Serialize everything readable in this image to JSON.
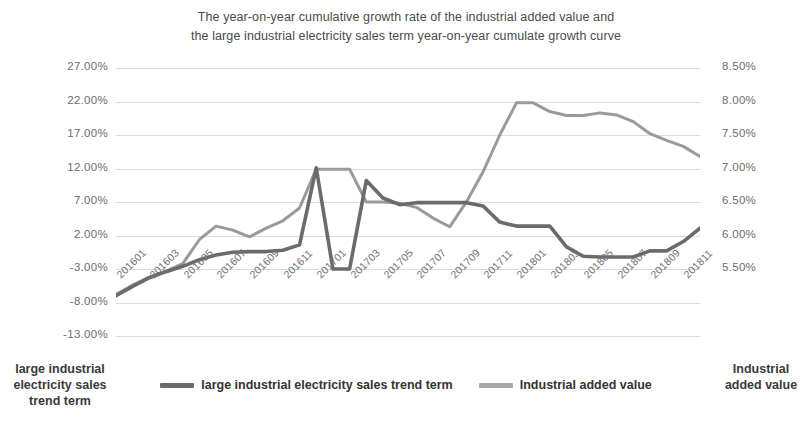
{
  "chart_data": {
    "type": "line",
    "title": "The year-on-year cumulative growth rate of the industrial added value and the large industrial electricity sales term year-on-year cumulate growth curve",
    "title_lines": [
      "The year-on-year cumulative growth rate of the industrial added value and",
      "the large industrial electricity sales term year-on-year cumulate growth curve"
    ],
    "xlabel": "",
    "grid": true,
    "legend_position": "bottom",
    "y_left": {
      "label": "large industrial electricity sales trend term",
      "ticks": [
        "27.00%",
        "22.00%",
        "17.00%",
        "12.00%",
        "7.00%",
        "2.00%",
        "-3.00%",
        "-8.00%",
        "-13.00%"
      ],
      "values": [
        27,
        22,
        17,
        12,
        7,
        2,
        -3,
        -8,
        -13
      ],
      "ylim": [
        -13,
        27
      ],
      "unit": "%"
    },
    "y_right": {
      "label": "Industrial added value",
      "ticks": [
        "8.50%",
        "8.00%",
        "7.50%",
        "7.00%",
        "6.50%",
        "6.00%",
        "5.50%"
      ],
      "values": [
        8.5,
        8.0,
        7.5,
        7.0,
        6.5,
        6.0,
        5.5
      ],
      "ylim": [
        5.5,
        8.5
      ],
      "unit": "%"
    },
    "x_tick_labels": [
      "201601",
      "201603",
      "201605",
      "201607",
      "201609",
      "201611",
      "201701",
      "201703",
      "201705",
      "201707",
      "201709",
      "201711",
      "201801",
      "201803",
      "201805",
      "201807",
      "201809",
      "201811"
    ],
    "categories": [
      "201601",
      "201602",
      "201603",
      "201604",
      "201605",
      "201606",
      "201607",
      "201608",
      "201609",
      "201610",
      "201611",
      "201612",
      "201701",
      "201702",
      "201703",
      "201704",
      "201705",
      "201706",
      "201707",
      "201708",
      "201709",
      "201710",
      "201711",
      "201712",
      "201801",
      "201802",
      "201803",
      "201804",
      "201805",
      "201806",
      "201807",
      "201808",
      "201809",
      "201810",
      "201811",
      "201812"
    ],
    "series": [
      {
        "name": "large industrial electricity sales trend term",
        "color": "#6b6b6b",
        "axis": "left",
        "values": [
          -7.0,
          -5.6,
          -4.3,
          -3.4,
          -2.6,
          -1.6,
          -0.9,
          -0.5,
          -0.4,
          -0.4,
          -0.2,
          0.6,
          12.1,
          -3.0,
          -3.0,
          10.2,
          7.6,
          6.6,
          6.9,
          6.9,
          6.9,
          6.9,
          6.4,
          4.0,
          3.4,
          3.4,
          3.4,
          0.3,
          -1.1,
          -1.2,
          -1.2,
          -1.2,
          -0.3,
          -0.3,
          1.1,
          3.1
        ]
      },
      {
        "name": "Industrial added value",
        "color": "#9a9a9a",
        "axis": "left",
        "values": [
          -6.8,
          -5.4,
          -4.2,
          -3.3,
          -2.2,
          1.4,
          3.4,
          2.8,
          1.8,
          3.1,
          4.2,
          6.1,
          11.9,
          11.9,
          11.9,
          7.0,
          7.0,
          6.8,
          6.2,
          4.6,
          3.3,
          7.0,
          11.5,
          17.0,
          21.8,
          21.8,
          20.5,
          19.9,
          19.9,
          20.3,
          20.0,
          19.0,
          17.2,
          16.2,
          15.3,
          13.8
        ]
      }
    ],
    "series_rendered": [
      {
        "name": "large industrial electricity sales trend term",
        "note": "darker thicker line, plotted against left axis percentage scale"
      },
      {
        "name": "Industrial added value",
        "note": "lighter gray line, plotted against left axis percentage scale"
      }
    ]
  },
  "legend": {
    "items": [
      {
        "label": "large industrial electricity sales trend term",
        "color": "#6b6b6b"
      },
      {
        "label": "Industrial added value",
        "color": "#a8a8a8"
      }
    ]
  },
  "axis_titles": {
    "left": "large industrial electricity sales trend term",
    "right": "Industrial added value"
  },
  "colors": {
    "grid": "#d6dde3",
    "text": "#6d6d6d",
    "series_dark": "#6b6b6b",
    "series_light": "#a8a8a8",
    "background": "#ffffff"
  }
}
